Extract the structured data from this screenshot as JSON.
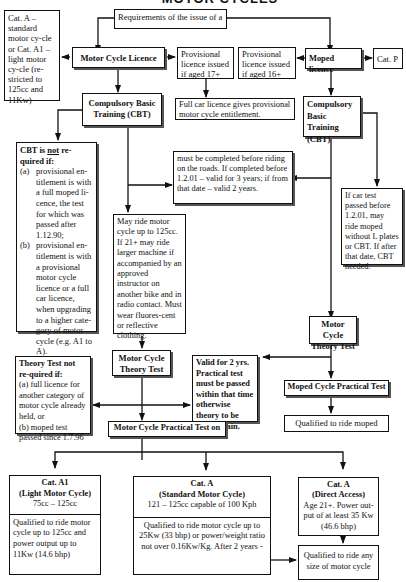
{
  "header": {
    "title": "MOTOR CYCLES"
  },
  "top": {
    "requirements": "Requirements of the issue of a"
  },
  "left_note": {
    "text": "Cat. A –standard motor cy-cle or Cat. A1 – light motor cy-cle (re-stricted to 125cc and 11Kw)"
  },
  "motorcycle": {
    "licence": "Motor Cycle Licence",
    "provisional": "Provisional licence issued if aged 17+",
    "full_car": "Full car licence gives provisional motor cycle entitlement.",
    "cbt": "Compulsory Basic Training (CBT)",
    "cbt_not_required": {
      "title_pre": "CBT is ",
      "title_underline": "not",
      "title_post": " re-quired if:",
      "items": [
        {
          "label": "(a)",
          "text": "provisional en-titlement is with a full moped li-cence, the test for which was passed after 1.12.90;"
        },
        {
          "label": "(b)",
          "text": "provisional en-titlement is with a provisional motor cycle licence or a full car licence, when upgrading to a higher cate-gory of motor cycle (e.g. A1 to A)."
        }
      ]
    },
    "cbt_validity": "must be completed before riding on the roads.  If completed before 1.2.01 – valid for 3 years; if from that date – valid 2 years.",
    "may_ride": "May ride motor cycle up to 125cc. If 21+ may ride larger machine if accompanied by an approved instructor on another bike and in radio contact. Must wear fluores-cent or reflective clothing.",
    "theory_test": "Motor Cycle Theory Test",
    "theory_not_required": {
      "title": "Theory Test not re-quired if:",
      "a": "(a) full licence for another category of motor cycle already held, or",
      "b": "(b) moped test passed since 1.7.96"
    },
    "valid_2yrs": "Valid for 2 yrs. Practical test must be passed within that time otherwise theory to be taken again.",
    "practical_test": "Motor Cycle Practical Test on",
    "categories": [
      {
        "title": "Cat. A1",
        "subtitle": "(Light Motor Cycle)",
        "spec": "75cc – 125cc",
        "result": "Qualified to ride motor cycle up to 125cc and power output up to 11Kw (14.6 bhp)"
      },
      {
        "title": "Cat. A",
        "subtitle": "(Standard Motor Cycle)",
        "spec": "121 – 125cc capable of 100 Kph",
        "result": "Qualified to ride motor cycle up to 25Kw (33 bhp) or power/weight ratio not over 0.16Kw/Kg.  After 2 years -"
      },
      {
        "title": "Cat. A",
        "subtitle": "(Direct Access)",
        "spec": "Age 21+. Power out-put of at least 35 Kw (46.6 bhp)",
        "result": "Qualified to ride any size of motor cycle"
      }
    ]
  },
  "moped": {
    "licence": "Moped licence",
    "category": "Cat. P",
    "provisional": "Provisional licence issued if aged 16+",
    "cbt": "Compulsory Basic Training (CBT)",
    "car_test_note": "If car test passed before 1.2.01, may ride moped without L plates or CBT. If after that date, CBT needed.",
    "theory_test": "Motor Cycle Theory Test",
    "practical_test": "Moped Cycle Practical Test",
    "qualified": "Qualified to ride moped"
  }
}
